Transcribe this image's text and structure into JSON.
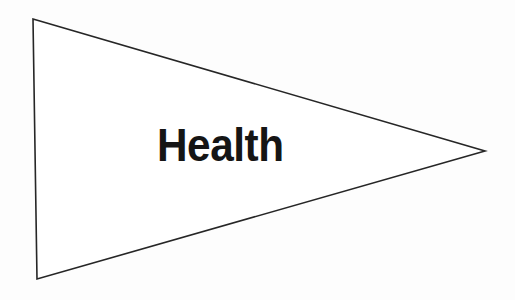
{
  "canvas": {
    "width": 515,
    "height": 300,
    "background_color": "#fdfdfd"
  },
  "diagram": {
    "type": "triangle-pennant",
    "title": "Health",
    "orientation": "points-right",
    "shape": {
      "name": "triangle",
      "fill_color": "#ffffff",
      "stroke_color": "#262626",
      "stroke_width": 1.6,
      "points": "33,19 485,151 37,279",
      "vertices": [
        {
          "name": "top-left",
          "x": 33,
          "y": 19
        },
        {
          "name": "right-tip",
          "x": 485,
          "y": 151
        },
        {
          "name": "bottom-left",
          "x": 37,
          "y": 279
        }
      ]
    },
    "label": {
      "text": "Health",
      "color": "#151515",
      "font_size_px": 47,
      "weight": "bold",
      "x": 157,
      "y": 120
    }
  }
}
